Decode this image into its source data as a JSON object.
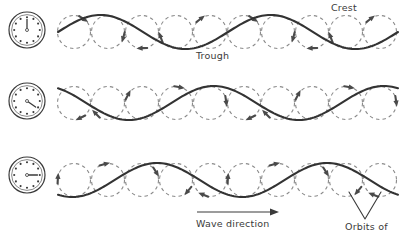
{
  "figure": {
    "labels": {
      "crest": "Crest",
      "trough": "Trough",
      "wave_direction": "Wave direction",
      "orbits_of": "Orbits of"
    },
    "colors": {
      "wave_line": "#333333",
      "orbit_circle": "#8a8a8a",
      "arrow": "#4a4a4a",
      "clock_face": "#ffffff",
      "clock_rim": "#3a3a3a",
      "background": "#ffffff",
      "text": "#3a3a3a"
    }
  },
  "clocks": [
    {
      "name": "clock-row-1",
      "hand_hours": 12,
      "hand_angle_deg": 0,
      "cx": 27,
      "cy": 30,
      "r": 18
    },
    {
      "name": "clock-row-2",
      "hand_hours": 4,
      "hand_angle_deg": 125,
      "cx": 27,
      "cy": 101,
      "r": 18
    },
    {
      "name": "clock-row-3",
      "hand_hours": 3,
      "hand_angle_deg": 90,
      "cx": 27,
      "cy": 175,
      "r": 18
    }
  ],
  "chart_data": {
    "type": "line",
    "xlabel": "Wave direction",
    "ylabel": "",
    "grid": false,
    "legend": null,
    "annotations": [
      "Crest",
      "Trough",
      "Wave direction",
      "Orbits of"
    ],
    "rows": [
      {
        "name": "row-1",
        "time_index": 0,
        "clock_hours": 12,
        "baseline_y": 32,
        "amplitude": 17,
        "wavelength": 170,
        "phase_deg": 0,
        "x_start": 58,
        "x_end": 398,
        "circle_radius": 16.5,
        "circle_centers_x": [
          74,
          108,
          142,
          176,
          210,
          244,
          278,
          312,
          346,
          380
        ],
        "circle_center_y": 32
      },
      {
        "name": "row-2",
        "time_index": 1,
        "clock_hours": 4,
        "baseline_y": 103,
        "amplitude": 17,
        "wavelength": 170,
        "phase_deg": 120,
        "x_start": 58,
        "x_end": 398,
        "circle_radius": 16.5,
        "circle_centers_x": [
          74,
          108,
          142,
          176,
          210,
          244,
          278,
          312,
          346,
          380
        ],
        "circle_center_y": 103
      },
      {
        "name": "row-3",
        "time_index": 2,
        "clock_hours": 3,
        "baseline_y": 180,
        "amplitude": 17,
        "wavelength": 170,
        "phase_deg": 240,
        "x_start": 58,
        "x_end": 398,
        "circle_radius": 16.5,
        "circle_centers_x": [
          74,
          108,
          142,
          176,
          210,
          244,
          278,
          312,
          346,
          380
        ],
        "circle_center_y": 180
      }
    ]
  }
}
